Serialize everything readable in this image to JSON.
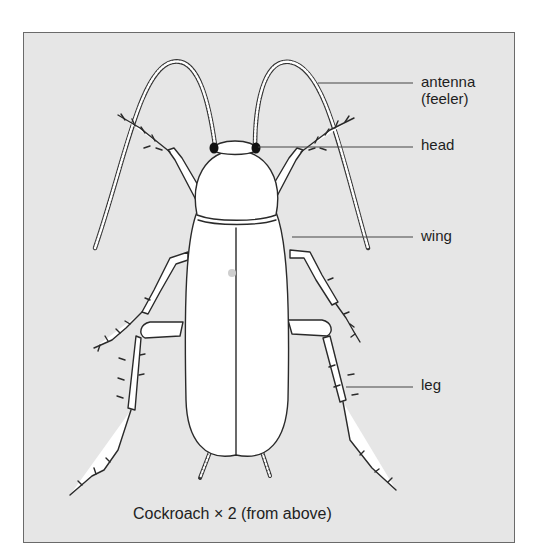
{
  "diagram": {
    "subject": "cockroach",
    "view": "dorsal",
    "background_color": "#e6e6e6",
    "line_color": "#2a2a2a",
    "labels": [
      {
        "id": "antenna",
        "text": "antenna",
        "subtext": "(feeler)"
      },
      {
        "id": "head",
        "text": "head"
      },
      {
        "id": "wing",
        "text": "wing"
      },
      {
        "id": "leg",
        "text": "leg"
      }
    ],
    "caption": "Cockroach × 2 (from above)"
  }
}
